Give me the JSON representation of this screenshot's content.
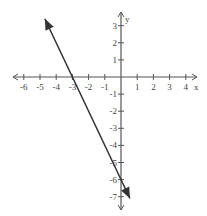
{
  "chart_data": {
    "type": "line",
    "title": "",
    "xlabel": "x",
    "ylabel": "y",
    "xlim": [
      -6.5,
      4.5
    ],
    "ylim": [
      -7.8,
      3.9
    ],
    "grid": false,
    "x_ticks": [
      -6,
      -5,
      -4,
      -3,
      -2,
      -1,
      1,
      2,
      3,
      4
    ],
    "y_ticks": [
      3,
      2,
      1,
      -1,
      -2,
      -3,
      -4,
      -5,
      -6,
      -7
    ],
    "series": [
      {
        "name": "y = -2x - 6",
        "equation": "y = -2x - 6",
        "slope": -2,
        "y_intercept": -6,
        "x_intercept": -3,
        "x": [
          -4.7,
          -3,
          0,
          0.55
        ],
        "y": [
          3.4,
          0,
          -6,
          -7.1
        ],
        "arrows_both_ends": true,
        "color": "#333333"
      }
    ]
  },
  "axes": {
    "x_label": "x",
    "y_label": "y",
    "x_tick_labels": [
      "-6",
      "-5",
      "-4",
      "-3",
      "-2",
      "-1",
      "1",
      "2",
      "3",
      "4"
    ],
    "y_tick_labels": [
      "3",
      "2",
      "1",
      "-1",
      "-2",
      "-3",
      "-4",
      "-5",
      "-6",
      "-7"
    ]
  }
}
